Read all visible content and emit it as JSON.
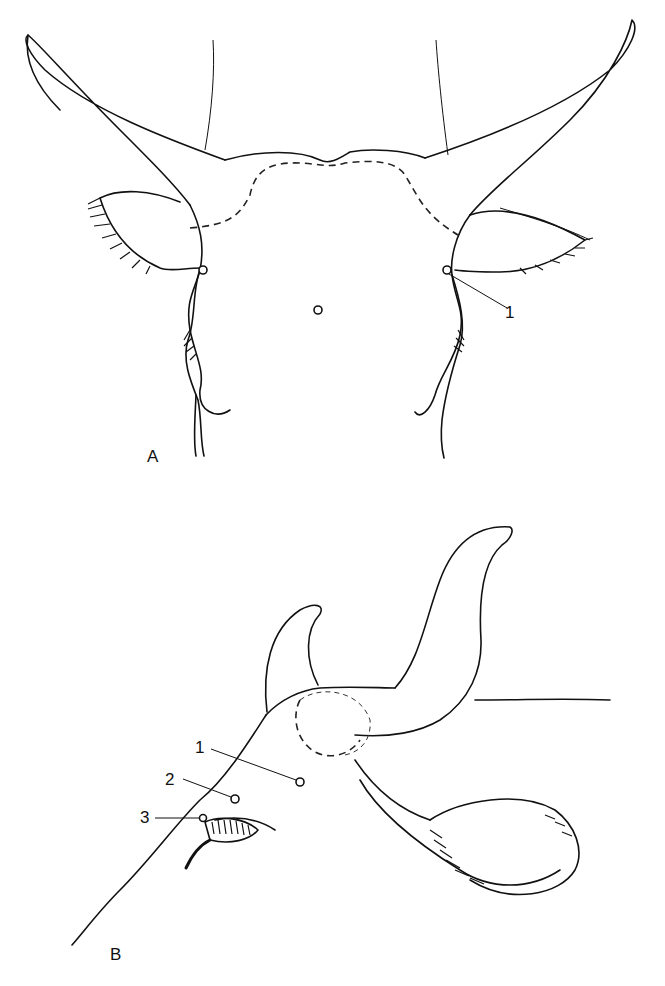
{
  "figure": {
    "panels": [
      {
        "id": "A",
        "label": "A",
        "view": "frontal view of bovine head with horns",
        "callouts": [
          {
            "number": "1",
            "description": "marked point near right base of horn / ear"
          }
        ]
      },
      {
        "id": "B",
        "label": "B",
        "view": "lateral oblique view of bovine head with horns",
        "callouts": [
          {
            "number": "1",
            "description": "point on forehead below horn base"
          },
          {
            "number": "2",
            "description": "point above eye"
          },
          {
            "number": "3",
            "description": "point at medial canthus of eye"
          }
        ]
      }
    ]
  }
}
